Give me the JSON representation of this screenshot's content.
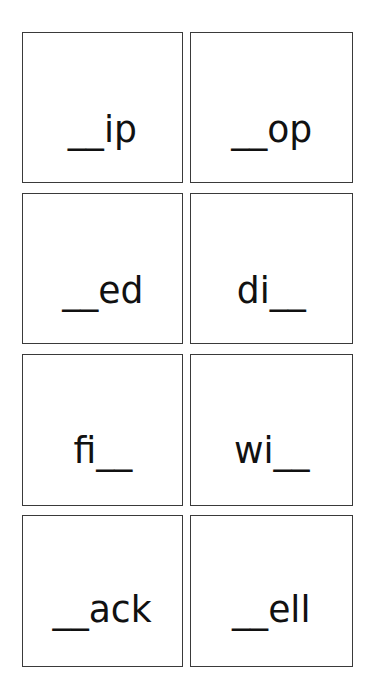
{
  "worksheet": {
    "cards": [
      {
        "text": "__ip"
      },
      {
        "text": "__op"
      },
      {
        "text": "__ed"
      },
      {
        "text": "di__"
      },
      {
        "text": "fi__"
      },
      {
        "text": "wi__"
      },
      {
        "text": "__ack"
      },
      {
        "text": "__ell"
      }
    ],
    "colors": {
      "background": "#ffffff",
      "border": "#3a3a3a",
      "text": "#111111"
    }
  }
}
